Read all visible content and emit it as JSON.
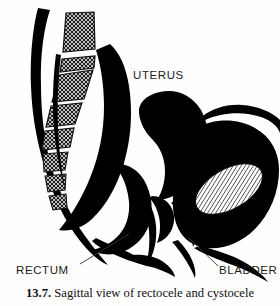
{
  "figure": {
    "kind": "medical-line-illustration",
    "subject": "Sagittal view of rectocele and cystocele",
    "colors": {
      "ink": "#000000",
      "paper": "#fefefe",
      "hatch": "#1a1a1a",
      "leader_line": "#333333"
    }
  },
  "labels": {
    "uterus": "UTERUS",
    "rectum": "RECTUM",
    "bladder": "BLADDER"
  },
  "caption": {
    "number": "13.7.",
    "text": "Sagittal view of rectocele and cystocele"
  },
  "structures": [
    {
      "name": "sacrum-vertebral-column",
      "fill": "cross-hatch"
    },
    {
      "name": "uterus",
      "fill": "solid-black"
    },
    {
      "name": "bladder",
      "fill": "diagonal-hatch"
    },
    {
      "name": "rectum",
      "fill": "solid-black"
    },
    {
      "name": "pelvic-soft-tissue",
      "fill": "solid-black"
    }
  ],
  "leaders": [
    {
      "name": "rectum-leader",
      "from": [
        80,
        264
      ],
      "to": [
        129,
        234
      ]
    },
    {
      "name": "bladder-leader",
      "from": [
        219,
        266
      ],
      "to": [
        188,
        238
      ]
    }
  ]
}
